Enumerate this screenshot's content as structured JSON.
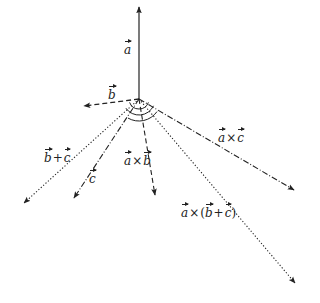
{
  "diagram": {
    "title": "",
    "origin": {
      "x": 139,
      "y": 99
    },
    "vectors": [
      {
        "id": "a",
        "label": "a",
        "tip": {
          "x": 139,
          "y": 6
        },
        "style": "solid",
        "color": "#222222"
      },
      {
        "id": "b",
        "label": "b",
        "tip": {
          "x": 83,
          "y": 106
        },
        "style": "dashed",
        "color": "#222222"
      },
      {
        "id": "c",
        "label": "c",
        "tip": {
          "x": 73,
          "y": 199
        },
        "style": "dashdot",
        "color": "#222222"
      },
      {
        "id": "b_plus_c",
        "label": "b + c",
        "tip": {
          "x": 23,
          "y": 204
        },
        "style": "dotted",
        "color": "#222222"
      },
      {
        "id": "a_cross_b",
        "label": "a × b",
        "tip": {
          "x": 155,
          "y": 196
        },
        "style": "dashed",
        "color": "#222222"
      },
      {
        "id": "a_cross_c",
        "label": "a × c",
        "tip": {
          "x": 295,
          "y": 191
        },
        "style": "dashdot",
        "color": "#222222"
      },
      {
        "id": "a_cross_b_plus_c",
        "label": "a × (b + c)",
        "tip": {
          "x": 296,
          "y": 284
        },
        "style": "dotted",
        "color": "#222222"
      }
    ],
    "arcs": [
      {
        "radius": 10,
        "from_deg": 20,
        "to_deg": 160
      },
      {
        "radius": 16,
        "from_deg": 25,
        "to_deg": 145
      },
      {
        "radius": 22,
        "from_deg": 35,
        "to_deg": 120
      }
    ],
    "labels": {
      "a": {
        "sym": "a"
      },
      "b": {
        "sym": "b"
      },
      "c": {
        "sym": "c"
      },
      "b_plus_c": {
        "s1": "b",
        "op": "+",
        "s2": "c"
      },
      "a_cross_b": {
        "s1": "a",
        "op": "×",
        "s2": "b"
      },
      "a_cross_c": {
        "s1": "a",
        "op": "×",
        "s2": "c"
      },
      "a_cross_b_plus_c": {
        "s1": "a",
        "op1": "×",
        "open": "(",
        "s2": "b",
        "op2": "+",
        "s3": "c",
        "close": ")"
      }
    }
  }
}
